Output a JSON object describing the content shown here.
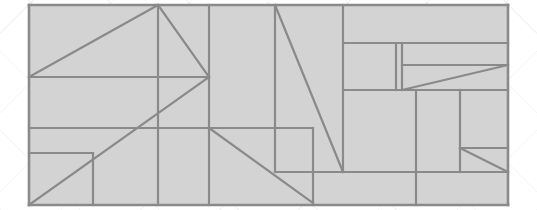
{
  "canvas": {
    "width": 537,
    "height": 210,
    "background_color": "#ffffff",
    "hatch_color": "#f0f0f0",
    "title": "floor-plan-line-drawing"
  },
  "drawing": {
    "name": "architectural-floorplan-wireframe",
    "fill_color": "#cfcfcf",
    "line_color": "#8a8a8a",
    "line_width": 2.2,
    "outer_bounds": {
      "x1": 29,
      "y1": 5,
      "x2": 508,
      "y2": 205
    },
    "segments": [
      {
        "name": "outer-top",
        "x1": 29,
        "y1": 5,
        "x2": 508,
        "y2": 5
      },
      {
        "name": "outer-right",
        "x1": 508,
        "y1": 5,
        "x2": 508,
        "y2": 205
      },
      {
        "name": "outer-bottom",
        "x1": 508,
        "y1": 205,
        "x2": 29,
        "y2": 205
      },
      {
        "name": "outer-left",
        "x1": 29,
        "y1": 205,
        "x2": 29,
        "y2": 5
      },
      {
        "name": "horiz-upper-left",
        "x1": 29,
        "y1": 77,
        "x2": 209,
        "y2": 77
      },
      {
        "name": "diag-upper-left",
        "x1": 29,
        "y1": 77,
        "x2": 158,
        "y2": 5
      },
      {
        "name": "vert-col-158",
        "x1": 158,
        "y1": 5,
        "x2": 158,
        "y2": 205
      },
      {
        "name": "diag-upper-mid",
        "x1": 158,
        "y1": 5,
        "x2": 209,
        "y2": 77
      },
      {
        "name": "vert-col-209",
        "x1": 209,
        "y1": 5,
        "x2": 209,
        "y2": 205
      },
      {
        "name": "diag-long-left",
        "x1": 29,
        "y1": 205,
        "x2": 209,
        "y2": 77
      },
      {
        "name": "horiz-mid-left",
        "x1": 29,
        "y1": 128,
        "x2": 313,
        "y2": 128
      },
      {
        "name": "horiz-low-left",
        "x1": 29,
        "y1": 153,
        "x2": 93,
        "y2": 153
      },
      {
        "name": "vert-col-93",
        "x1": 93,
        "y1": 153,
        "x2": 93,
        "y2": 205
      },
      {
        "name": "vert-col-275-upper",
        "x1": 275,
        "y1": 5,
        "x2": 275,
        "y2": 172
      },
      {
        "name": "diag-center-long",
        "x1": 275,
        "y1": 5,
        "x2": 343,
        "y2": 172
      },
      {
        "name": "diag-mid-lower",
        "x1": 209,
        "y1": 128,
        "x2": 313,
        "y2": 203
      },
      {
        "name": "vert-col-313",
        "x1": 313,
        "y1": 128,
        "x2": 313,
        "y2": 205
      },
      {
        "name": "vert-col-343",
        "x1": 343,
        "y1": 5,
        "x2": 343,
        "y2": 172
      },
      {
        "name": "horiz-right-43",
        "x1": 343,
        "y1": 43,
        "x2": 508,
        "y2": 43
      },
      {
        "name": "horiz-right-90",
        "x1": 343,
        "y1": 90,
        "x2": 508,
        "y2": 90
      },
      {
        "name": "vert-narrow-396",
        "x1": 396,
        "y1": 43,
        "x2": 396,
        "y2": 90
      },
      {
        "name": "vert-narrow-402",
        "x1": 402,
        "y1": 43,
        "x2": 402,
        "y2": 90
      },
      {
        "name": "horiz-right-65",
        "x1": 402,
        "y1": 65,
        "x2": 508,
        "y2": 65
      },
      {
        "name": "diag-right-wedge",
        "x1": 402,
        "y1": 90,
        "x2": 508,
        "y2": 65
      },
      {
        "name": "vert-col-416",
        "x1": 416,
        "y1": 90,
        "x2": 416,
        "y2": 205
      },
      {
        "name": "vert-col-460",
        "x1": 460,
        "y1": 90,
        "x2": 460,
        "y2": 172
      },
      {
        "name": "horiz-right-148",
        "x1": 460,
        "y1": 148,
        "x2": 508,
        "y2": 148
      },
      {
        "name": "diag-right-lower",
        "x1": 460,
        "y1": 148,
        "x2": 508,
        "y2": 172
      },
      {
        "name": "horiz-bottom-band",
        "x1": 313,
        "y1": 172,
        "x2": 508,
        "y2": 172
      },
      {
        "name": "horiz-center-172",
        "x1": 275,
        "y1": 172,
        "x2": 343,
        "y2": 172
      }
    ]
  }
}
